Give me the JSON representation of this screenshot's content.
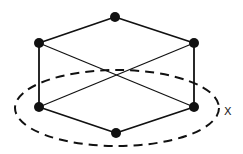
{
  "diagram": {
    "label": "X",
    "nodes": [
      {
        "id": "top",
        "x": 115,
        "y": 17
      },
      {
        "id": "upper-left",
        "x": 39,
        "y": 43
      },
      {
        "id": "upper-right",
        "x": 194,
        "y": 43
      },
      {
        "id": "lower-left",
        "x": 39,
        "y": 107
      },
      {
        "id": "lower-right",
        "x": 194,
        "y": 107
      },
      {
        "id": "bottom",
        "x": 116,
        "y": 133
      }
    ],
    "edges": [
      [
        "top",
        "upper-left"
      ],
      [
        "top",
        "upper-right"
      ],
      [
        "upper-left",
        "lower-left"
      ],
      [
        "upper-right",
        "lower-right"
      ],
      [
        "upper-left",
        "lower-right"
      ],
      [
        "upper-right",
        "lower-left"
      ],
      [
        "lower-left",
        "bottom"
      ],
      [
        "lower-right",
        "bottom"
      ]
    ],
    "ellipse": {
      "cx": 117,
      "cy": 108,
      "rx": 102,
      "ry": 38
    }
  }
}
